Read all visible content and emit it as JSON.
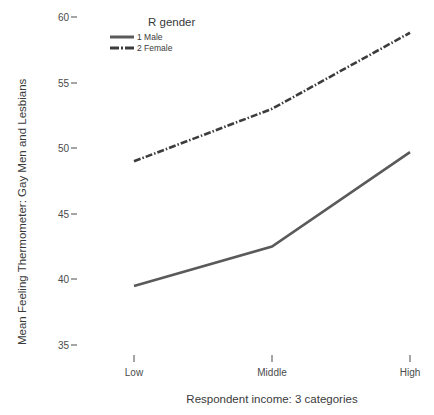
{
  "chart_data": {
    "type": "line",
    "title": "",
    "xlabel": "Respondent income: 3 categories",
    "ylabel": "Mean Feeling Thermometer: Gay Men and Lesbians",
    "categories": [
      "Low",
      "Middle",
      "High"
    ],
    "xtick_labels": [
      "Low",
      "Middle",
      "High"
    ],
    "ytick_labels": [
      "35",
      "40",
      "45",
      "50",
      "55",
      "60"
    ],
    "ytick_values": [
      35,
      40,
      45,
      50,
      55,
      60
    ],
    "ylim": [
      33.5,
      61.0
    ],
    "grid": false,
    "legend_position": "top-center",
    "legend_title": "R gender",
    "series": [
      {
        "name": "1 Male",
        "values": [
          39.5,
          42.5,
          49.7
        ],
        "style": "solid",
        "color": "#5a5a5a"
      },
      {
        "name": "2 Female",
        "values": [
          49.0,
          53.0,
          58.8
        ],
        "style": "dash-dot",
        "color": "#3c3c3c"
      }
    ]
  },
  "legend": {
    "title": "R gender",
    "items": [
      {
        "label": "1 Male",
        "style": "solid"
      },
      {
        "label": "2 Female",
        "style": "dash-dot"
      }
    ]
  },
  "axes": {
    "y_title": "Mean Feeling Thermometer: Gay Men and Lesbians",
    "x_title": "Respondent income: 3 categories",
    "y_ticks": [
      "60",
      "55",
      "50",
      "45",
      "40",
      "35"
    ],
    "x_ticks": [
      "Low",
      "Middle",
      "High"
    ]
  },
  "colors": {
    "male_line": "#5a5a5a",
    "female_line": "#3c3c3c",
    "text": "#3a3a3a",
    "background": "#ffffff"
  }
}
